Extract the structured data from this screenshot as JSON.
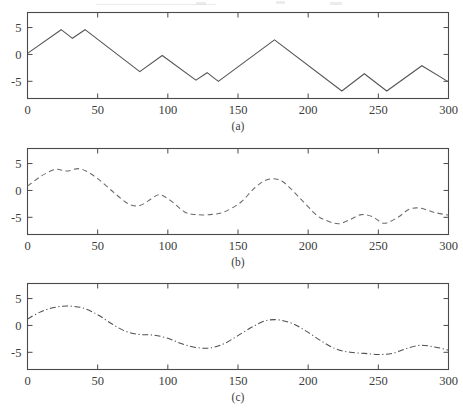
{
  "figure": {
    "background_color": "#ffffff",
    "line_color": "#555555",
    "axis_color": "#4a4a4a",
    "text_color": "#3c3c3c",
    "panel_captions": [
      "(a)",
      "(b)",
      "(c)"
    ]
  },
  "axes": {
    "xlabel": "",
    "ylabel": "",
    "xticks": [
      0,
      50,
      100,
      150,
      200,
      250,
      300
    ],
    "xticklabels": [
      "0",
      "50",
      "100",
      "150",
      "200",
      "250",
      "300"
    ],
    "yticks": [
      5,
      0,
      -5
    ],
    "yticklabels": [
      "5",
      "0",
      "-5"
    ],
    "xlim": [
      0,
      300
    ],
    "ylim": [
      -8.2,
      7.8
    ],
    "grid": false
  },
  "chart_data": [
    {
      "type": "line",
      "title": "(a)",
      "xlabel": "",
      "ylabel": "",
      "xlim": [
        0,
        300
      ],
      "ylim": [
        -8.2,
        7.8
      ],
      "grid": false,
      "legend": null,
      "linestyle": "solid",
      "color": "#555555",
      "series": [
        {
          "name": "signal-a",
          "x": [
            0,
            24,
            32,
            41,
            80,
            96,
            120,
            128,
            136,
            176,
            224,
            240,
            256,
            281,
            300
          ],
          "y": [
            0.2,
            4.6,
            3.0,
            4.6,
            -3.2,
            -0.2,
            -4.8,
            -3.4,
            -5.0,
            2.7,
            -6.8,
            -3.6,
            -6.8,
            -2.1,
            -5.1
          ]
        }
      ]
    },
    {
      "type": "line",
      "title": "(b)",
      "xlabel": "",
      "ylabel": "",
      "xlim": [
        0,
        300
      ],
      "ylim": [
        -8.2,
        7.8
      ],
      "grid": false,
      "legend": null,
      "linestyle": "dashed",
      "color": "#6a6a6a",
      "series": [
        {
          "name": "signal-b-smoothed",
          "x": [
            0,
            10,
            20,
            28,
            38,
            50,
            62,
            72,
            80,
            88,
            94,
            102,
            112,
            120,
            130,
            140,
            152,
            162,
            172,
            182,
            194,
            206,
            214,
            222,
            230,
            238,
            246,
            254,
            264,
            272,
            280,
            290,
            300
          ],
          "y": [
            0.8,
            2.7,
            3.9,
            3.6,
            4.0,
            2.2,
            -0.5,
            -2.5,
            -2.8,
            -1.6,
            -0.8,
            -1.9,
            -4.0,
            -4.5,
            -4.5,
            -4.0,
            -2.2,
            0.5,
            2.1,
            1.6,
            -1.4,
            -4.6,
            -5.7,
            -6.2,
            -5.4,
            -4.5,
            -4.9,
            -6.1,
            -5.0,
            -3.5,
            -3.3,
            -4.1,
            -4.6
          ]
        }
      ]
    },
    {
      "type": "line",
      "title": "(c)",
      "xlabel": "",
      "ylabel": "",
      "xlim": [
        0,
        300
      ],
      "ylim": [
        -8.2,
        7.8
      ],
      "grid": false,
      "legend": null,
      "linestyle": "dashdot",
      "color": "#4f4f4f",
      "series": [
        {
          "name": "signal-c-smoothed",
          "x": [
            0,
            10,
            20,
            30,
            40,
            50,
            60,
            70,
            80,
            90,
            100,
            110,
            120,
            130,
            140,
            150,
            160,
            170,
            180,
            190,
            200,
            210,
            220,
            230,
            240,
            250,
            260,
            270,
            280,
            290,
            300
          ],
          "y": [
            1.2,
            2.6,
            3.4,
            3.6,
            3.2,
            2.0,
            0.3,
            -1.1,
            -1.7,
            -1.8,
            -2.4,
            -3.4,
            -4.1,
            -4.2,
            -3.4,
            -1.9,
            -0.3,
            0.9,
            1.0,
            0.2,
            -1.3,
            -3.0,
            -4.4,
            -5.0,
            -5.2,
            -5.4,
            -5.2,
            -4.3,
            -3.7,
            -4.0,
            -4.6
          ]
        }
      ]
    }
  ]
}
